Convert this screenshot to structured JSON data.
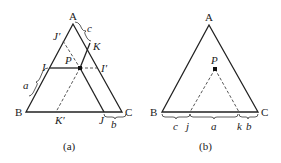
{
  "panel_a": {
    "vertices": {
      "A": "A",
      "B": "B",
      "C": "C"
    },
    "points": {
      "P": "P",
      "I": "I",
      "I_prime": "I′",
      "J": "J",
      "J_prime": "J′",
      "K": "K",
      "K_prime": "K′"
    },
    "segments": {
      "a": "a",
      "b": "b",
      "c": "c"
    },
    "caption": "(a)"
  },
  "panel_b": {
    "vertices": {
      "A": "A",
      "B": "B",
      "C": "C"
    },
    "points": {
      "P": "P",
      "j": "j",
      "k": "k"
    },
    "segments": {
      "a": "a",
      "b": "b",
      "c": "c"
    },
    "caption": "(b)"
  },
  "colors": {
    "line": "#222222",
    "dashed": "#444444"
  }
}
